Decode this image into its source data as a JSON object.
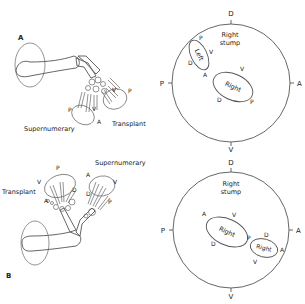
{
  "panels": {
    "a": {
      "label": "A",
      "supernumerary": "Supernumerary",
      "transplant": "Transplant",
      "axis_labels": {
        "p1": "P",
        "v1": "V",
        "a1": "A",
        "v2": "V",
        "p2": "P"
      }
    },
    "b": {
      "label": "B",
      "supernumerary": "Supernumerary",
      "transplant": "Transplant",
      "axis_labels": {
        "p1": "P",
        "v1": "V",
        "d1": "D",
        "a1": "A",
        "a2": "A",
        "v2": "V",
        "d2": "D",
        "p2": "P"
      }
    }
  },
  "stump_top": {
    "title_line1": "Right",
    "title_line2": "stump",
    "compass": {
      "top": "D",
      "bottom": "V",
      "left": "P",
      "right": "A"
    },
    "left_ellipse": {
      "label": "Left",
      "p": "P",
      "v": "V",
      "d": "D",
      "a": "A"
    },
    "right_ellipse": {
      "label": "Right",
      "v": "V",
      "d": "D",
      "p": "P"
    }
  },
  "stump_bottom": {
    "title_line1": "Right",
    "title_line2": "stump",
    "compass": {
      "top": "D",
      "bottom": "V",
      "left": "P",
      "right": "A"
    },
    "big_ellipse": {
      "label": "Right",
      "a": "A",
      "v": "V",
      "d": "D",
      "p": "P"
    },
    "small_ellipse": {
      "label": "Right",
      "d": "D",
      "a": "A",
      "v": "V"
    }
  }
}
